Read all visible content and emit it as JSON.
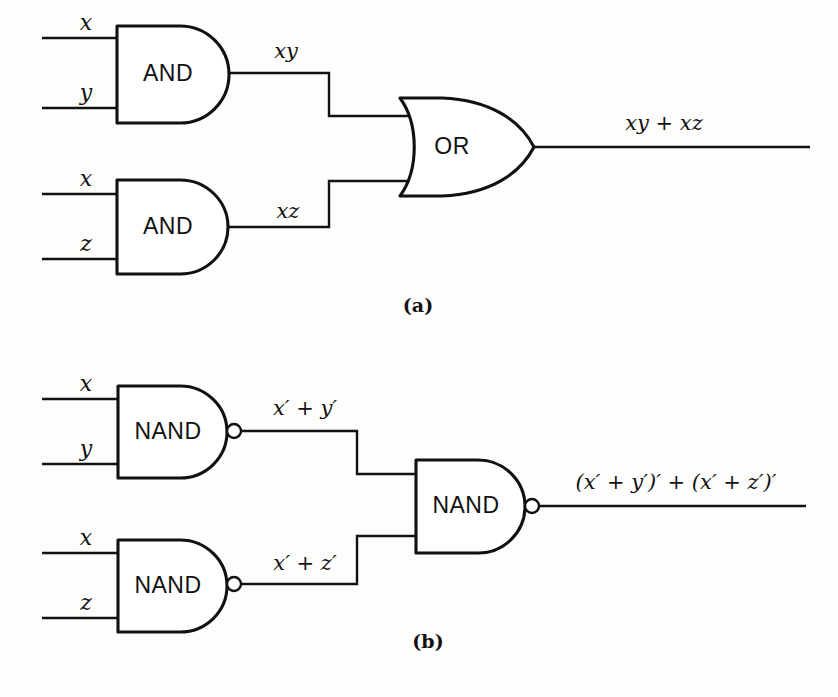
{
  "figure": {
    "background_color": "#fdfdfc",
    "line_color": "#111111",
    "parts": [
      {
        "id": "part-a",
        "caption": "(a)",
        "description": "Two AND gates feeding an OR gate",
        "gates": [
          {
            "name": "and-gate-top",
            "label": "AND",
            "inputs": [
              "x",
              "y"
            ],
            "output": "xy",
            "bubble": false
          },
          {
            "name": "and-gate-bottom",
            "label": "AND",
            "inputs": [
              "x",
              "z"
            ],
            "output": "xz",
            "bubble": false
          },
          {
            "name": "or-gate",
            "label": "OR",
            "inputs": [
              "xy",
              "xz"
            ],
            "output": "xy + xz",
            "bubble": false
          }
        ],
        "input_labels": [
          "x",
          "y",
          "x",
          "z"
        ],
        "intermediate_labels": [
          "xy",
          "xz"
        ],
        "output_label": "xy + xz"
      },
      {
        "id": "part-b",
        "caption": "(b)",
        "description": "Two NAND gates feeding a NAND gate",
        "gates": [
          {
            "name": "nand-gate-top",
            "label": "NAND",
            "inputs": [
              "x",
              "y"
            ],
            "output": "x′ + y′",
            "bubble": true
          },
          {
            "name": "nand-gate-bottom",
            "label": "NAND",
            "inputs": [
              "x",
              "z"
            ],
            "output": "x′ + z′",
            "bubble": true
          },
          {
            "name": "nand-gate-right",
            "label": "NAND",
            "inputs": [
              "x′ + y′",
              "x′ + z′"
            ],
            "output": "(x′ + y′)′ + (x′ + z′)′",
            "bubble": true
          }
        ],
        "input_labels": [
          "x",
          "y",
          "x",
          "z"
        ],
        "intermediate_labels": [
          "x′ + y′",
          "x′ + z′"
        ],
        "output_label": "(x′ + y′)′ + (x′ + z′)′"
      }
    ]
  },
  "labels": {
    "a_in_x1": "x",
    "a_in_y": "y",
    "a_in_x2": "x",
    "a_in_z": "z",
    "a_and_top": "AND",
    "a_and_bottom": "AND",
    "a_or": "OR",
    "a_mid_xy": "xy",
    "a_mid_xz": "xz",
    "a_out": "xy + xz",
    "a_caption": "(a)",
    "b_in_x1": "x",
    "b_in_y": "y",
    "b_in_x2": "x",
    "b_in_z": "z",
    "b_nand_top": "NAND",
    "b_nand_bottom": "NAND",
    "b_nand_right": "NAND",
    "b_mid_xy": "x′ + y′",
    "b_mid_xz": "x′ + z′",
    "b_out": "(x′ + y′)′ + (x′ + z′)′",
    "b_caption": "(b)"
  }
}
